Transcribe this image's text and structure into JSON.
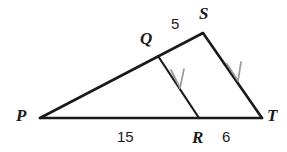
{
  "figure": {
    "type": "geometry-diagram",
    "background_color": "#ffffff",
    "stroke_color": "#1a1a1a",
    "arrow_color": "#9a9a9a",
    "points": {
      "P": {
        "x": 40,
        "y": 118
      },
      "Q": {
        "x": 158,
        "y": 56
      },
      "R": {
        "x": 199,
        "y": 118
      },
      "S": {
        "x": 203,
        "y": 33
      },
      "T": {
        "x": 262,
        "y": 118
      }
    },
    "segments": [
      {
        "name": "PS",
        "from": "P",
        "to": "S"
      },
      {
        "name": "PT",
        "from": "P",
        "to": "T"
      },
      {
        "name": "ST",
        "from": "S",
        "to": "T"
      },
      {
        "name": "QR",
        "from": "Q",
        "to": "R"
      }
    ],
    "parallel_marks": [
      {
        "on": "QR",
        "x": 178,
        "y": 80
      },
      {
        "on": "ST",
        "x": 234,
        "y": 73
      }
    ],
    "vertex_labels": [
      {
        "id": "P",
        "text": "P"
      },
      {
        "id": "Q",
        "text": "Q"
      },
      {
        "id": "R",
        "text": "R"
      },
      {
        "id": "S",
        "text": "S"
      },
      {
        "id": "T",
        "text": "T"
      }
    ],
    "measure_labels": [
      {
        "id": "QS",
        "text": "5",
        "segment": "QS"
      },
      {
        "id": "PR",
        "text": "15",
        "segment": "PR"
      },
      {
        "id": "RT",
        "text": "6",
        "segment": "RT"
      }
    ]
  }
}
